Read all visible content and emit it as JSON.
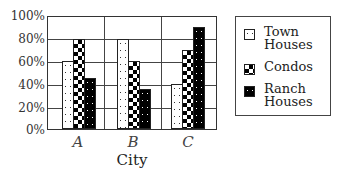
{
  "chart_data": {
    "type": "bar",
    "title": "",
    "xlabel": "City",
    "ylabel": "",
    "categories": [
      "A",
      "B",
      "C"
    ],
    "series": [
      {
        "name": "Town Houses",
        "pattern": "dotted-white",
        "values": [
          60,
          80,
          40
        ]
      },
      {
        "name": "Condos",
        "pattern": "checkerboard",
        "values": [
          80,
          60,
          70
        ]
      },
      {
        "name": "Ranch Houses",
        "pattern": "dotted-black",
        "values": [
          45,
          35,
          90
        ]
      }
    ],
    "ylim": [
      0,
      100
    ],
    "yticks": [
      "0%",
      "20%",
      "40%",
      "60%",
      "80%",
      "100%"
    ],
    "grid": {
      "horizontal": true,
      "vertical_group_dividers": true
    },
    "legend_position": "right"
  },
  "legend": {
    "items": [
      {
        "label_line1": "Town",
        "label_line2": "Houses"
      },
      {
        "label_line1": "Condos",
        "label_line2": ""
      },
      {
        "label_line1": "Ranch",
        "label_line2": "Houses"
      }
    ]
  },
  "colors": {
    "background": "#ffffff",
    "bars_dark": "#000000",
    "axis": "#333333"
  }
}
